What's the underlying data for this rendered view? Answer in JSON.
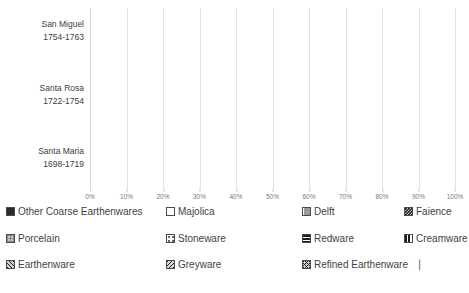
{
  "chart_data": {
    "type": "bar",
    "orientation": "horizontal",
    "stacked": true,
    "normalized_percent": true,
    "title": "",
    "xlabel": "",
    "ylabel": "",
    "xlim": [
      0,
      100
    ],
    "grid": true,
    "legend_position": "bottom",
    "xticks": [
      "0%",
      "10%",
      "20%",
      "30%",
      "40%",
      "50%",
      "60%",
      "70%",
      "80%",
      "90%",
      "100%"
    ],
    "xtick_values": [
      0,
      10,
      20,
      30,
      40,
      50,
      60,
      70,
      80,
      90,
      100
    ],
    "categories": [
      {
        "name": "San Miguel",
        "date_range": "1754-1763"
      },
      {
        "name": "Santa Rosa",
        "date_range": "1722-1754"
      },
      {
        "name": "Santa Maria",
        "date_range": "1698-1719"
      }
    ],
    "series": [
      {
        "name": "Other Coarse Earthenwares",
        "pattern": "solid-dark",
        "values": [
          36.0,
          50.0,
          56.0
        ]
      },
      {
        "name": "Majolica",
        "pattern": "light",
        "values": [
          21.0,
          39.5,
          41.0
        ]
      },
      {
        "name": "Delft",
        "pattern": "grey",
        "values": [
          12.8,
          3.2,
          0.4
        ]
      },
      {
        "name": "Faience",
        "pattern": "checker-dark",
        "values": [
          3.2,
          3.4,
          1.0
        ]
      },
      {
        "name": "Porcelain",
        "pattern": "porcelain",
        "values": [
          3.3,
          0.7,
          0.4
        ]
      },
      {
        "name": "Stoneware",
        "pattern": "stoneware",
        "values": [
          11.8,
          1.0,
          0.3
        ]
      },
      {
        "name": "Redware",
        "pattern": "redware",
        "values": [
          4.6,
          1.2,
          0.4
        ]
      },
      {
        "name": "Creamware",
        "pattern": "creamware",
        "values": [
          6.1,
          0.4,
          0.2
        ]
      },
      {
        "name": "Earthenware",
        "pattern": "earthenware",
        "values": [
          1.2,
          0.3,
          0.1
        ]
      },
      {
        "name": "Greyware",
        "pattern": "greyware",
        "values": [
          0.0,
          0.2,
          0.1
        ]
      },
      {
        "name": "Refined Earthenware",
        "pattern": "refined",
        "values": [
          0.0,
          0.1,
          0.1
        ]
      }
    ]
  },
  "legend": {
    "rows": [
      [
        {
          "label": "Other Coarse Earthenwares",
          "swatch": "solid-dark"
        },
        {
          "label": "Majolica",
          "swatch": "majolica"
        },
        {
          "label": "Delft",
          "swatch": "delft"
        },
        {
          "label": "Faience",
          "swatch": "checker-dark"
        }
      ],
      [
        {
          "label": "Porcelain",
          "swatch": "porcelain"
        },
        {
          "label": "Stoneware",
          "swatch": "stoneware"
        },
        {
          "label": "Redware",
          "swatch": "redware"
        },
        {
          "label": "Creamware",
          "swatch": "creamware"
        }
      ],
      [
        {
          "label": "Earthenware",
          "swatch": "earthenware"
        },
        {
          "label": "Greyware",
          "swatch": "greyware"
        },
        {
          "label": "Refined Earthenware",
          "swatch": "refined",
          "tail": "▕"
        }
      ]
    ]
  },
  "colors": {
    "background": "#ffffff",
    "gridline": "#e2e2e2",
    "dark_fill": "#2b2b2b",
    "light_fill": "#dcdcdc",
    "grey_fill": "#808080",
    "text": "#3f3f3f",
    "tick_text": "#7a7a7a"
  }
}
